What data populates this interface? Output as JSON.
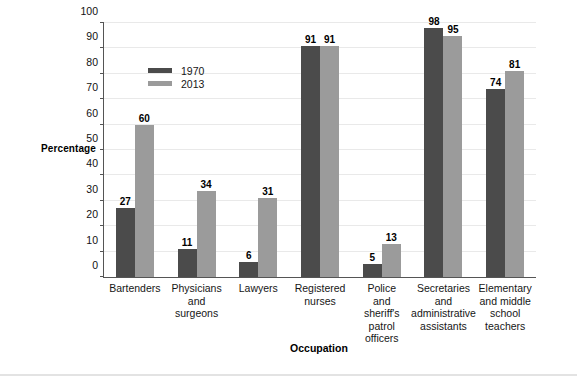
{
  "chart_data": {
    "type": "bar",
    "title": "",
    "xlabel": "Occupation",
    "ylabel": "Percentage",
    "ylim": [
      0,
      100
    ],
    "yticks": [
      0,
      10,
      20,
      30,
      40,
      50,
      60,
      70,
      80,
      90,
      100
    ],
    "grid": true,
    "legend_position": "inside-upper-left",
    "categories": [
      "Bartenders",
      "Physicians\nand\nsurgeons",
      "Lawyers",
      "Registered\nnurses",
      "Police\nand\nsheriff's\npatrol\nofficers",
      "Secretaries\nand\nadministrative\nassistants",
      "Elementary\nand middle\nschool\nteachers"
    ],
    "series": [
      {
        "name": "1970",
        "color": "#4b4b4b",
        "values": [
          27,
          11,
          6,
          91,
          5,
          98,
          74
        ]
      },
      {
        "name": "2013",
        "color": "#9b9b9b",
        "values": [
          60,
          34,
          31,
          91,
          13,
          95,
          81
        ]
      }
    ]
  }
}
